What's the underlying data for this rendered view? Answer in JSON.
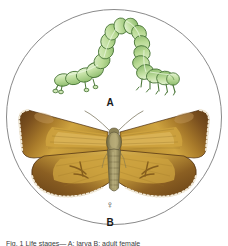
{
  "plate": {
    "frame_shape": "circle",
    "background_color": "#ffffff",
    "border_color": "#8a8a8a"
  },
  "figures": [
    {
      "id": "A",
      "label": "A",
      "subject": "looper-caterpillar",
      "description": "green looper caterpillar in arched crawling pose",
      "colors": {
        "body_light": "#d7ecc0",
        "body_mid": "#b6d996",
        "body_dark": "#8fbd6e",
        "outline": "#4e7a3c"
      }
    },
    {
      "id": "B",
      "label": "B",
      "subject": "adult-moth-female",
      "sex_symbol": "♀",
      "description": "adult female moth, wings spread, brown margins with ochre fields",
      "colors": {
        "wing_border": "#7a4f1e",
        "wing_border_dark": "#5e3a14",
        "wing_field": "#c79a33",
        "wing_field_light": "#d9b356",
        "fringe": "#f2ead8",
        "body": "#9a8f63",
        "body_dark": "#7a7049",
        "antenna": "#8e8a76"
      }
    }
  ],
  "labels": {
    "figure_a": "A",
    "figure_b": "B",
    "female_symbol": "♀"
  },
  "caption": {
    "text": "Fig. 1 Life stages— A: larva  B: adult female"
  }
}
